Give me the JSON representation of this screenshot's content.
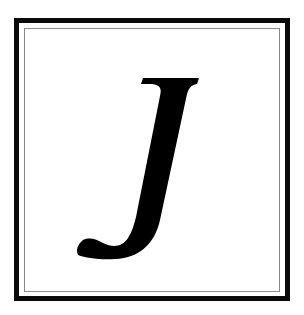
{
  "tile": {
    "letter": "J",
    "letter_style": "italic serif",
    "colors": {
      "letter": "#000000",
      "outer_border": "#0a0a0a",
      "inner_border": "#8a8a8a",
      "background": "#ffffff"
    }
  }
}
